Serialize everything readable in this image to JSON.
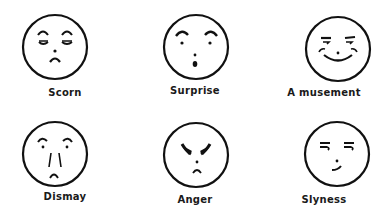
{
  "figure": {
    "background": "#ffffff",
    "ink": "#111111",
    "faces": [
      {
        "id": "scorn",
        "label": "Scorn",
        "expression": "raised brows, half-closed eyes, downturned small mouth"
      },
      {
        "id": "surprise",
        "label": "Surprise",
        "expression": "arched brows, dot eyes, small round open mouth"
      },
      {
        "id": "amusement",
        "label": "A musement",
        "expression": "flat brows, smiling wide mouth, cheek lines"
      },
      {
        "id": "dismay",
        "label": "Dismay",
        "expression": "arched brows, long nose lines, frown"
      },
      {
        "id": "anger",
        "label": "Anger",
        "expression": "heavy V-shaped brows, small frown"
      },
      {
        "id": "slyness",
        "label": "Slyness",
        "expression": "flat hooked brows, smirk"
      }
    ]
  }
}
